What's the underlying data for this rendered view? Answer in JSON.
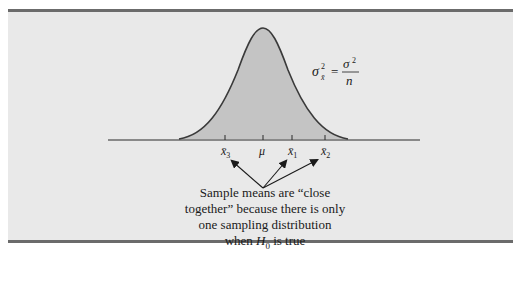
{
  "figure": {
    "type": "sampling-distribution-diagram",
    "formula": {
      "lhs": "σ",
      "lhs_sup": "2",
      "lhs_sub": "x̄",
      "equals": "=",
      "numerator": "σ",
      "numerator_sup": "2",
      "denominator": "n"
    },
    "axis_labels": [
      {
        "id": "x3",
        "text": "x̄",
        "sub": "3",
        "x": 225
      },
      {
        "id": "mu",
        "text": "μ",
        "sub": "",
        "x": 263
      },
      {
        "id": "x1",
        "text": "x̄",
        "sub": "1",
        "x": 292
      },
      {
        "id": "x2",
        "text": "x̄",
        "sub": "2",
        "x": 325
      }
    ],
    "caption": {
      "line1": "Sample means are “close",
      "line2": "together” because there is only",
      "line3": "one sampling distribution",
      "line4_pre": "when ",
      "line4_var": "H",
      "line4_sub": "0",
      "line4_post": " is true"
    },
    "colors": {
      "panel_bg": "#e9e9e9",
      "panel_border": "#6b6b6b",
      "curve_fill": "#c4c4c4",
      "curve_stroke": "#3a3a3a",
      "axis": "#2a2a2a"
    }
  }
}
